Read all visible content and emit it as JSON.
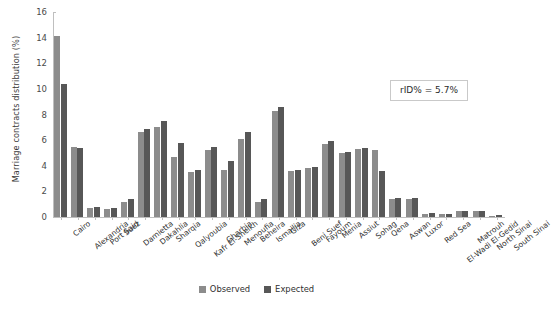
{
  "chart_data": {
    "type": "bar",
    "title": "",
    "xlabel": "",
    "ylabel": "Marriage contracts distribution (%)",
    "ylim": [
      0,
      16
    ],
    "yticks": [
      0,
      2,
      4,
      6,
      8,
      10,
      12,
      14,
      16
    ],
    "grid": false,
    "legend_position": "bottom-center",
    "annotation": "rID% = 5.7%",
    "categories": [
      "Cairo",
      "Alexandria",
      "Port Said",
      "Suez",
      "Damietta",
      "Dakahlia",
      "Sharqia",
      "Qalyoubia",
      "Kafr El-Sheikh",
      "Gharbia",
      "Menoufia",
      "Beheira",
      "Ismailia",
      "Giza",
      "Beni Suef",
      "Fayoum",
      "Menia",
      "Assiut",
      "Sohag",
      "Qena",
      "Aswan",
      "Luxor",
      "Red Sea",
      "El-Wadi El-Gedid",
      "Matrouh",
      "North Sinai",
      "South Sinai"
    ],
    "series": [
      {
        "name": "Observed",
        "color": "#8c8c8c",
        "values": [
          14.1,
          5.5,
          0.7,
          0.65,
          1.15,
          6.6,
          7.0,
          4.7,
          3.5,
          5.2,
          3.7,
          6.1,
          1.2,
          8.3,
          3.6,
          3.8,
          5.7,
          5.0,
          5.3,
          5.2,
          1.4,
          1.4,
          0.25,
          0.2,
          0.45,
          0.45,
          0.1
        ]
      },
      {
        "name": "Expected",
        "color": "#575757",
        "values": [
          10.4,
          5.4,
          0.75,
          0.7,
          1.4,
          6.9,
          7.5,
          5.8,
          3.7,
          5.5,
          4.4,
          6.6,
          1.4,
          8.6,
          3.7,
          3.9,
          5.9,
          5.1,
          5.4,
          3.6,
          1.5,
          1.5,
          0.3,
          0.25,
          0.5,
          0.5,
          0.15
        ]
      }
    ]
  },
  "legend": {
    "items": [
      {
        "label": "Observed"
      },
      {
        "label": "Expected"
      }
    ]
  }
}
